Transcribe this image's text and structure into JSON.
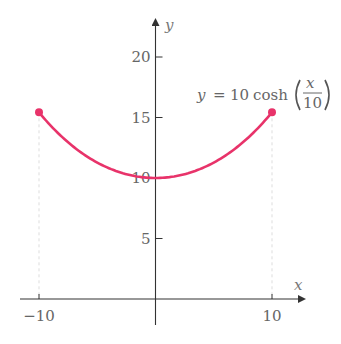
{
  "chart_data": {
    "type": "line",
    "title": "",
    "xlabel": "x",
    "ylabel": "y",
    "function": "y = 10 cosh(x/10)",
    "annotation": {
      "lhs": "y",
      "eq": "=",
      "coef": "10",
      "fn": "cosh",
      "frac_num": "x",
      "frac_den": "10"
    },
    "x_ticks": [
      {
        "value": -10,
        "label": "−10"
      },
      {
        "value": 10,
        "label": "10"
      }
    ],
    "y_ticks": [
      {
        "value": 5,
        "label": "5"
      },
      {
        "value": 10,
        "label": "10"
      },
      {
        "value": 15,
        "label": "15"
      },
      {
        "value": 20,
        "label": "20"
      }
    ],
    "xlim": [
      -12,
      13
    ],
    "ylim": [
      -2,
      23
    ],
    "domain": [
      -10,
      10
    ],
    "endpoints": [
      {
        "x": -10,
        "y": 15.43
      },
      {
        "x": 10,
        "y": 15.43
      }
    ],
    "series": [
      {
        "name": "y = 10 cosh(x/10)",
        "x": [
          -10,
          -8,
          -6,
          -4,
          -2,
          0,
          2,
          4,
          6,
          8,
          10
        ],
        "y": [
          15.43,
          13.37,
          11.85,
          10.81,
          10.2,
          10.0,
          10.2,
          10.81,
          11.85,
          13.37,
          15.43
        ]
      }
    ],
    "colors": {
      "curve": "#e8336a",
      "axes": "#555555",
      "guides": "#dddddd"
    },
    "grid": false,
    "legend": "none"
  }
}
